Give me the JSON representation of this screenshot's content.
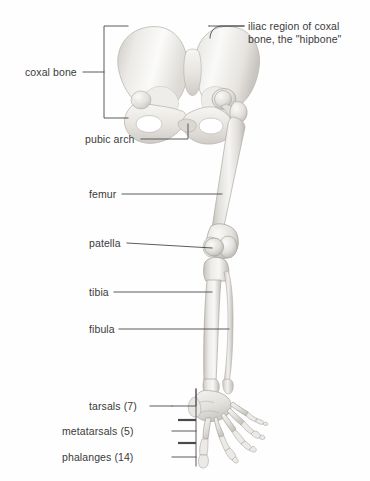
{
  "figure": {
    "background_color": "#fefefe",
    "label_color": "#3a3a3a",
    "leader_line_color": "#4a4a4a",
    "bone_fill_light": "#f3f2f0",
    "bone_fill_mid": "#dedcd8",
    "bone_fill_shadow": "#b9b6b1",
    "bone_outline": "#a8a5a0"
  },
  "labels": [
    {
      "id": "iliac-region",
      "text": "iliac region of coxal bone, the \"hipbone\"",
      "line1": "iliac region of coxal",
      "line2": "bone, the \"hipbone\"",
      "x": 248,
      "y": 20,
      "align": "left"
    },
    {
      "id": "coxal-bone",
      "text": "coxal bone",
      "x": 25,
      "y": 66,
      "align": "left"
    },
    {
      "id": "pubic-arch",
      "text": "pubic arch",
      "x": 85,
      "y": 134,
      "align": "left"
    },
    {
      "id": "femur",
      "text": "femur",
      "x": 89,
      "y": 189,
      "align": "left"
    },
    {
      "id": "patella",
      "text": "patella",
      "x": 89,
      "y": 239,
      "align": "left"
    },
    {
      "id": "tibia",
      "text": "tibia",
      "x": 89,
      "y": 287,
      "align": "left"
    },
    {
      "id": "fibula",
      "text": "fibula",
      "x": 89,
      "y": 324,
      "align": "left"
    },
    {
      "id": "tarsals",
      "text": "tarsals (7)",
      "count": 7,
      "x": 89,
      "y": 401,
      "align": "left"
    },
    {
      "id": "metatarsals",
      "text": "metatarsals (5)",
      "count": 5,
      "x": 89,
      "y": 426,
      "align": "left"
    },
    {
      "id": "phalanges",
      "text": "phalanges (14)",
      "count": 14,
      "x": 89,
      "y": 452,
      "align": "left"
    }
  ],
  "bones": [
    {
      "id": "coxal-bone",
      "name": "coxal bone (hipbone)",
      "region": "pelvic girdle"
    },
    {
      "id": "ilium",
      "name": "iliac region",
      "region": "pelvic girdle"
    },
    {
      "id": "pubic-arch",
      "name": "pubic arch",
      "region": "pelvic girdle"
    },
    {
      "id": "femur",
      "name": "femur",
      "region": "thigh"
    },
    {
      "id": "patella",
      "name": "patella",
      "region": "knee"
    },
    {
      "id": "tibia",
      "name": "tibia",
      "region": "leg"
    },
    {
      "id": "fibula",
      "name": "fibula",
      "region": "leg"
    },
    {
      "id": "tarsals",
      "name": "tarsals",
      "region": "foot",
      "count": 7
    },
    {
      "id": "metatarsals",
      "name": "metatarsals",
      "region": "foot",
      "count": 5
    },
    {
      "id": "phalanges",
      "name": "phalanges",
      "region": "foot",
      "count": 14
    }
  ]
}
